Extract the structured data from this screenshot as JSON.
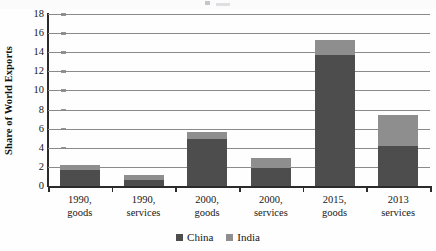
{
  "chart_data": {
    "type": "bar",
    "subtype": "stacked-bar",
    "title": "",
    "xlabel": "",
    "ylabel": "Share of World Exports",
    "ylim": [
      0,
      18
    ],
    "ytick_step": 2,
    "yticks": [
      0,
      2,
      4,
      6,
      8,
      10,
      12,
      14,
      16,
      18
    ],
    "grid": true,
    "grid_orientation": "horizontal",
    "legend_position": "bottom-center",
    "categories": [
      "1990,\ngoods",
      "1990,\nservices",
      "2000,\ngoods",
      "2000,\nservices",
      "2015,\ngoods",
      "2013\nservices"
    ],
    "series": [
      {
        "name": "China",
        "color": "#4d4d4d",
        "values": [
          1.7,
          0.6,
          4.9,
          1.85,
          13.7,
          4.2
        ]
      },
      {
        "name": "India",
        "color": "#8e8e8e",
        "values": [
          0.55,
          0.6,
          0.8,
          1.1,
          1.6,
          3.2
        ]
      }
    ],
    "stack_totals": [
      2.25,
      1.2,
      5.7,
      2.95,
      15.3,
      7.4
    ]
  },
  "legend": {
    "entries": [
      {
        "label": "China",
        "color": "#4d4d4d"
      },
      {
        "label": "India",
        "color": "#8e8e8e"
      }
    ]
  }
}
